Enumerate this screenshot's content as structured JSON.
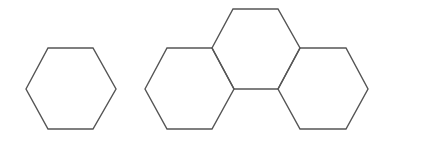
{
  "diagram": {
    "background": "#ffffff",
    "stroke_color": "#555555",
    "stroke_width": 1.4,
    "shapes": [
      {
        "name": "single-hexagon",
        "group": "single",
        "points": "26,89 48,48 93,48 116,89 93,129 48,129"
      },
      {
        "name": "cluster-left-hexagon",
        "group": "cluster",
        "points": "145,89 167,48 212,48 234,89 212,129 167,129"
      },
      {
        "name": "cluster-top-hexagon",
        "group": "cluster",
        "points": "212,48 233,9 278,9 300,48 278,89 234,89"
      },
      {
        "name": "cluster-right-hexagon",
        "group": "cluster",
        "points": "278,89 300,48 346,48 368,89 346,129 300,129"
      }
    ]
  }
}
